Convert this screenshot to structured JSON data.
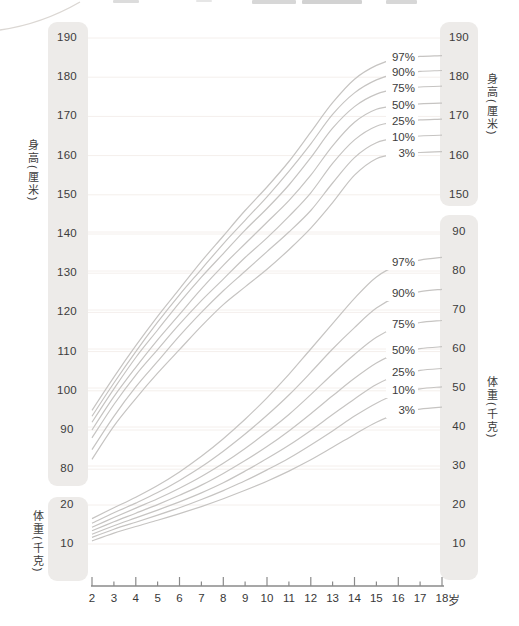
{
  "chart_data": {
    "type": "line",
    "title": "",
    "grid": true,
    "legend_position": "inline-right-of-curves",
    "x_axis": {
      "unit": "岁",
      "ticks": [
        2,
        3,
        4,
        5,
        6,
        7,
        8,
        9,
        10,
        11,
        12,
        13,
        14,
        15,
        16,
        17,
        18
      ],
      "range": [
        2,
        18
      ]
    },
    "height_axis": {
      "label": "身高(厘米)",
      "left_ticks": [
        190,
        180,
        170,
        160,
        150,
        140,
        130,
        120,
        110,
        100,
        90,
        80
      ],
      "right_ticks": [
        190,
        180,
        170,
        160,
        150
      ],
      "range": [
        80,
        190
      ]
    },
    "weight_axis": {
      "label": "体重(千克)",
      "left_ticks": [
        20,
        10
      ],
      "right_ticks": [
        90,
        80,
        70,
        60,
        50,
        40,
        30,
        20,
        10
      ],
      "range": [
        10,
        90
      ]
    },
    "ages": [
      2,
      3,
      4,
      5,
      6,
      7,
      8,
      9,
      10,
      11,
      12,
      13,
      14,
      15,
      16,
      17,
      18
    ],
    "percentiles": [
      "97%",
      "90%",
      "75%",
      "50%",
      "25%",
      "10%",
      "3%"
    ],
    "height_series": [
      {
        "name": "97%",
        "values": [
          95,
          103.5,
          111.5,
          119,
          126,
          133,
          139.5,
          146,
          152,
          158.5,
          166,
          173.5,
          179.5,
          183,
          184.8,
          185.3,
          185.5
        ]
      },
      {
        "name": "90%",
        "values": [
          93.5,
          102,
          110,
          117.5,
          124.5,
          131,
          137.5,
          143.5,
          149.5,
          156,
          163,
          170.5,
          176,
          179.3,
          181,
          181.5,
          181.7
        ]
      },
      {
        "name": "75%",
        "values": [
          92,
          100.5,
          108.5,
          115.5,
          122.5,
          129,
          135,
          141,
          146.5,
          152.5,
          159.5,
          167,
          172.5,
          175.7,
          177,
          177.5,
          177.7
        ]
      },
      {
        "name": "50%",
        "values": [
          90,
          98.5,
          106,
          113,
          119.5,
          126,
          132,
          137.5,
          143,
          148.5,
          155,
          162.5,
          168.5,
          171.8,
          172.7,
          173.2,
          173.4
        ]
      },
      {
        "name": "25%",
        "values": [
          88,
          96.5,
          104,
          110.5,
          117,
          123,
          128.5,
          134,
          139,
          144.5,
          150.5,
          158,
          164,
          167.5,
          168.6,
          169.1,
          169.3
        ]
      },
      {
        "name": "10%",
        "values": [
          85,
          93.5,
          101,
          107.5,
          114,
          120,
          125.5,
          130.5,
          135.5,
          140.5,
          146,
          153,
          159.5,
          163.3,
          164.5,
          165,
          165.2
        ]
      },
      {
        "name": "3%",
        "values": [
          82.5,
          91,
          98,
          104.5,
          110.5,
          116.5,
          122,
          126.5,
          131,
          136,
          141.5,
          148,
          155,
          159.2,
          160.4,
          160.8,
          161
        ]
      }
    ],
    "weight_series": [
      {
        "name": "97%",
        "values": [
          16.5,
          19.3,
          22,
          25,
          28.5,
          32.5,
          37,
          42,
          47.5,
          53.5,
          60,
          66.5,
          73,
          78.5,
          81.5,
          82.8,
          83.5
        ]
      },
      {
        "name": "90%",
        "values": [
          15.3,
          18,
          20.5,
          23.2,
          26.3,
          29.8,
          33.8,
          38.2,
          43,
          48.2,
          54,
          60,
          65.5,
          70.5,
          73.5,
          74.7,
          75.3
        ]
      },
      {
        "name": "75%",
        "values": [
          14.3,
          16.8,
          19.2,
          21.6,
          24.3,
          27.3,
          30.7,
          34.5,
          38.7,
          43.2,
          48.3,
          53.6,
          58.6,
          63,
          65.7,
          66.8,
          67.3
        ]
      },
      {
        "name": "50%",
        "values": [
          13.4,
          15.7,
          17.9,
          20.1,
          22.5,
          25.1,
          28.1,
          31.4,
          35,
          39,
          43.4,
          48,
          52.5,
          56.4,
          59,
          60.1,
          60.6
        ]
      },
      {
        "name": "25%",
        "values": [
          12.5,
          14.7,
          16.7,
          18.7,
          20.8,
          23.1,
          25.7,
          28.7,
          31.9,
          35.3,
          39.1,
          43.2,
          47.2,
          50.9,
          53.4,
          54.5,
          55
        ]
      },
      {
        "name": "10%",
        "values": [
          11.7,
          13.8,
          15.6,
          17.4,
          19.3,
          21.4,
          23.7,
          26.2,
          29,
          32,
          35.4,
          39,
          42.8,
          46.1,
          48.6,
          49.8,
          50.3
        ]
      },
      {
        "name": "3%",
        "values": [
          10.8,
          12.8,
          14.5,
          16.1,
          17.8,
          19.6,
          21.6,
          23.8,
          26.1,
          28.7,
          31.6,
          34.8,
          38.1,
          41.2,
          43.5,
          44.6,
          45.1
        ]
      }
    ]
  },
  "colors": {
    "curve": "#c6c4c2",
    "grid": "#f4efec",
    "band": "#edebe9",
    "text": "#3c3c3c",
    "axis": "#8a8a8a",
    "decor": "#dbd7d3"
  }
}
